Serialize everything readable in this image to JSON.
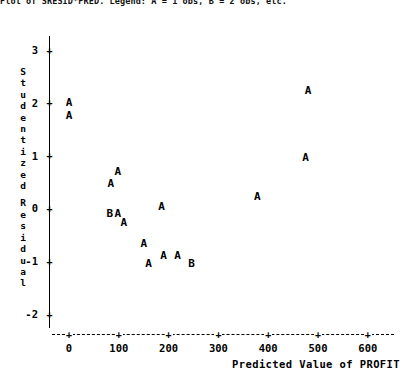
{
  "header": {
    "clipped_text": "Plot of SRESID*PRED.  Legend: A = 1 obs, B = 2 obs, etc."
  },
  "axes": {
    "y_title_chars": [
      "S",
      "t",
      "u",
      "d",
      "e",
      "n",
      "t",
      "i",
      "z",
      "e",
      "d",
      "",
      "R",
      "e",
      "s",
      "i",
      "d",
      "u",
      "a",
      "l"
    ],
    "x_title": "Predicted Value of PROFIT",
    "y_ticks": [
      "3",
      "2",
      "1",
      "0",
      "-1",
      "-2"
    ],
    "x_ticks": [
      "0",
      "100",
      "200",
      "300",
      "400",
      "500",
      "600"
    ],
    "tick_glyph": "+"
  },
  "chart_data": {
    "type": "scatter",
    "title": "",
    "xlabel": "Predicted Value of PROFIT",
    "ylabel": "Studentized Residual",
    "xlim": [
      -40,
      640
    ],
    "ylim": [
      -2.35,
      3.35
    ],
    "grid": false,
    "legend": "A = 1 observation, B = 2 observations",
    "marker_legend": {
      "A": 1,
      "B": 2
    },
    "zero_reference_line": false,
    "points": [
      {
        "label": "A",
        "count": 1,
        "x": 0,
        "y": 2.0
      },
      {
        "label": "A",
        "count": 1,
        "x": 0,
        "y": 1.75
      },
      {
        "label": "A",
        "count": 1,
        "x": 98,
        "y": 0.68
      },
      {
        "label": "A",
        "count": 1,
        "x": 84,
        "y": 0.47
      },
      {
        "label": "B",
        "count": 2,
        "x": 82,
        "y": -0.1
      },
      {
        "label": "A",
        "count": 1,
        "x": 98,
        "y": -0.1
      },
      {
        "label": "A",
        "count": 1,
        "x": 110,
        "y": -0.27
      },
      {
        "label": "A",
        "count": 1,
        "x": 150,
        "y": -0.67
      },
      {
        "label": "A",
        "count": 1,
        "x": 160,
        "y": -1.05
      },
      {
        "label": "A",
        "count": 1,
        "x": 190,
        "y": -0.9
      },
      {
        "label": "A",
        "count": 1,
        "x": 218,
        "y": -0.9
      },
      {
        "label": "B",
        "count": 2,
        "x": 246,
        "y": -1.05
      },
      {
        "label": "A",
        "count": 1,
        "x": 186,
        "y": 0.02
      },
      {
        "label": "A",
        "count": 1,
        "x": 378,
        "y": 0.22
      },
      {
        "label": "A",
        "count": 1,
        "x": 475,
        "y": 0.95
      },
      {
        "label": "A",
        "count": 1,
        "x": 480,
        "y": 2.22
      }
    ]
  }
}
